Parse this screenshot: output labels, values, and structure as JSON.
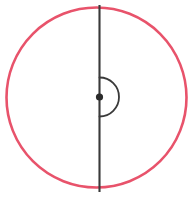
{
  "canvas": {
    "width": 194,
    "height": 197,
    "background_color": "#ffffff"
  },
  "figure": {
    "type": "geometry-diagram"
  },
  "colors": {
    "circle_stroke": "#e8536b",
    "line_stroke": "#3a3a3a",
    "arc_stroke": "#3a3a3a",
    "center_dot_fill": "#2b2b2b",
    "background": "#ffffff"
  },
  "shapes": {
    "circle": {
      "name": "circle-outline",
      "cx": 96.5,
      "cy": 97.5,
      "r": 90,
      "stroke_width": 2.6,
      "fill": "none"
    },
    "diameter_line": {
      "name": "vertical-diameter",
      "x1": 99.5,
      "y1": 5,
      "x2": 99.5,
      "y2": 192,
      "stroke_width": 2.1
    },
    "center_dot": {
      "name": "center-point",
      "cx": 99.5,
      "cy": 97,
      "r": 3.6
    },
    "angle_arc": {
      "name": "straight-angle-arc",
      "cx": 99.5,
      "cy": 97,
      "r": 19.5,
      "start_x": 99.5,
      "start_y": 77.5,
      "end_x": 99.5,
      "end_y": 116.5,
      "sweep_degrees": 180,
      "side": "right",
      "stroke_width": 1.8
    }
  }
}
